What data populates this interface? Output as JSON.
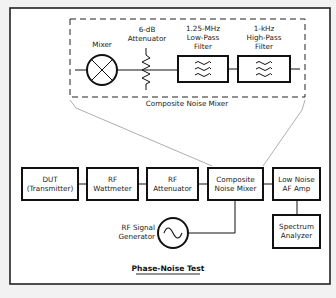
{
  "diagram": {
    "title": "Phase-Noise Test",
    "composite_detail": {
      "label": "Composite Noise Mixer",
      "mixer": {
        "label": "Mixer"
      },
      "attenuator": {
        "line1": "6-dB",
        "line2": "Attenuator"
      },
      "low_pass": {
        "line1": "1.25-MHz",
        "line2": "Low-Pass",
        "line3": "Filter"
      },
      "high_pass": {
        "line1": "1-kHz",
        "line2": "High-Pass",
        "line3": "Filter"
      }
    },
    "blocks": [
      {
        "id": "dut",
        "line1": "DUT",
        "line2": "(Transmitter)"
      },
      {
        "id": "wattmeter",
        "line1": "RF",
        "line2": "Wattmeter"
      },
      {
        "id": "attenuator",
        "line1": "RF",
        "line2": "Attenuator"
      },
      {
        "id": "composite",
        "line1": "Composite",
        "line2": "Noise Mixer"
      },
      {
        "id": "af_amp",
        "line1": "Low Noise",
        "line2": "AF Amp"
      },
      {
        "id": "spectrum",
        "line1": "Spectrum",
        "line2": "Analyzer"
      }
    ],
    "signal_generator": {
      "line1": "RF Signal",
      "line2": "Generator"
    },
    "colors": {
      "background": "#f2f2f2",
      "line": "#111111",
      "frame": "#222222"
    }
  }
}
